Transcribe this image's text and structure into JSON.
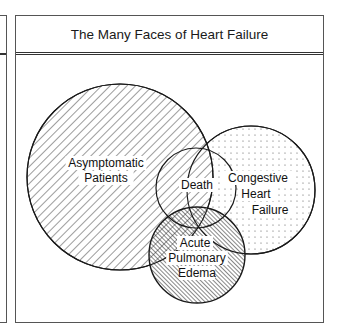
{
  "title": "The Many Faces of Heart Failure",
  "sets": [
    {
      "id": "asymptomatic",
      "label_lines": [
        "Asymptomatic",
        "Patients"
      ],
      "pattern": "diagonal-hatch"
    },
    {
      "id": "congestive",
      "label_lines": [
        "Congestive",
        "Heart",
        "Failure"
      ],
      "pattern": "dots"
    },
    {
      "id": "death",
      "label_lines": [
        "Death"
      ],
      "pattern": "none"
    },
    {
      "id": "edema",
      "label_lines": [
        "Acute",
        "Pulmonary",
        "Edema"
      ],
      "pattern": "dense-back-hatch"
    }
  ],
  "colors": {
    "ink": "#1a1a1a",
    "frame": "#555555",
    "background": "#ffffff"
  }
}
